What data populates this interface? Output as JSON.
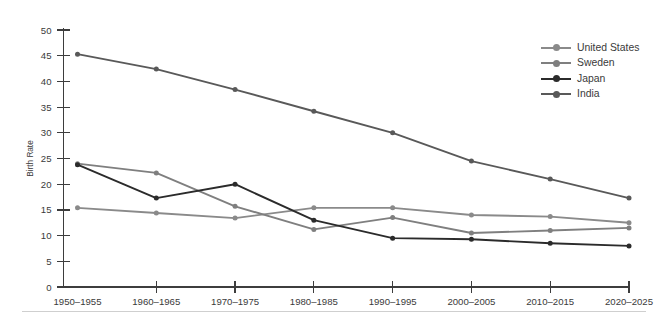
{
  "chart_data": {
    "type": "line",
    "title": "",
    "xlabel": "",
    "ylabel": "Birth Rate",
    "ylim": [
      0,
      50
    ],
    "ytick_step": 5,
    "grid": false,
    "legend_position": "right",
    "categories": [
      "1950–1955",
      "1960–1965",
      "1970–1975",
      "1980–1985",
      "1990–1995",
      "2000–2005",
      "2010–2015",
      "2020–2025"
    ],
    "yticks": [
      0,
      5,
      10,
      15,
      20,
      25,
      30,
      35,
      40,
      45,
      50
    ],
    "series": [
      {
        "name": "United States",
        "color": "#8a8a8a",
        "values": [
          15.4,
          14.4,
          13.4,
          15.4,
          15.4,
          14.0,
          13.7,
          12.5
        ]
      },
      {
        "name": "Sweden",
        "color": "#7f7f7f",
        "values": [
          24.0,
          22.2,
          15.7,
          11.2,
          13.5,
          10.5,
          11.0,
          11.5
        ]
      },
      {
        "name": "Japan",
        "color": "#2b2b2b",
        "values": [
          23.8,
          17.3,
          20.0,
          13.0,
          9.5,
          9.3,
          8.5,
          8.0
        ]
      },
      {
        "name": "India",
        "color": "#595959",
        "values": [
          45.3,
          42.4,
          38.4,
          34.2,
          30.0,
          24.5,
          21.0,
          17.3
        ]
      }
    ]
  }
}
